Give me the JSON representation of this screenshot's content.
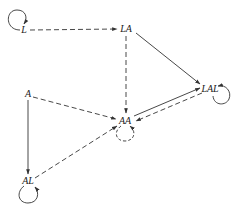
{
  "diagram": {
    "type": "state-transition-graph",
    "nodes": [
      {
        "id": "L",
        "label": "L",
        "x": 24,
        "y": 30,
        "self_loop": "solid"
      },
      {
        "id": "LA",
        "label": "LA",
        "x": 126,
        "y": 29,
        "self_loop": null
      },
      {
        "id": "A",
        "label": "A",
        "x": 28,
        "y": 94,
        "self_loop": null
      },
      {
        "id": "LAL",
        "label": "LAL",
        "x": 210,
        "y": 89,
        "self_loop": "solid"
      },
      {
        "id": "AA",
        "label": "AA",
        "x": 125,
        "y": 121,
        "self_loop": "dashed"
      },
      {
        "id": "AL",
        "label": "AL",
        "x": 28,
        "y": 181,
        "self_loop": "solid"
      }
    ],
    "edges": [
      {
        "from": "L",
        "to": "LA",
        "style": "dashed"
      },
      {
        "from": "LA",
        "to": "LAL",
        "style": "solid"
      },
      {
        "from": "LA",
        "to": "AA",
        "style": "dashed"
      },
      {
        "from": "A",
        "to": "AA",
        "style": "dashed"
      },
      {
        "from": "A",
        "to": "AL",
        "style": "solid"
      },
      {
        "from": "AL",
        "to": "AA",
        "style": "dashed"
      },
      {
        "from": "AA",
        "to": "LAL",
        "style": "solid"
      },
      {
        "from": "LAL",
        "to": "AA",
        "style": "dashed"
      }
    ],
    "colors": {
      "stroke": "#333333",
      "background": "#ffffff"
    }
  },
  "labels": {
    "L": "L",
    "LA": "LA",
    "A": "A",
    "LAL": "LAL",
    "AA": "AA",
    "AL": "AL"
  }
}
